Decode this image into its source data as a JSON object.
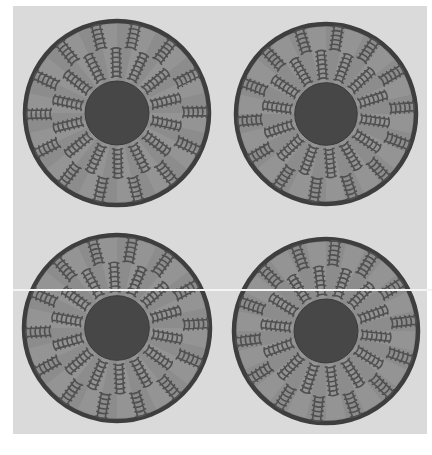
{
  "image": {
    "subject": "four woven coiled baskets viewed from above",
    "colors": {
      "page": "#ffffff",
      "panel": "#dadada",
      "rim": "#3e3e3e",
      "body": "#8c8c8c",
      "body_light": "#9a9a9a",
      "motif": "#505050",
      "center": "#474747",
      "scanline": "#f4f4f4"
    },
    "pattern": {
      "spokes": 14,
      "inner_ring": [
        0.38,
        0.68
      ],
      "outer_ring": [
        0.7,
        0.95
      ],
      "center_ratio": 0.34
    },
    "baskets": [
      {
        "id": "top-left",
        "cx": 117,
        "cy": 113,
        "r": 94,
        "rotation": 4
      },
      {
        "id": "top-right",
        "cx": 326,
        "cy": 114,
        "r": 92,
        "rotation": 0
      },
      {
        "id": "bottom-left",
        "cx": 117,
        "cy": 328,
        "r": 95,
        "rotation": 2
      },
      {
        "id": "bottom-right",
        "cx": 326,
        "cy": 331,
        "r": 94,
        "rotation": -2
      }
    ]
  }
}
